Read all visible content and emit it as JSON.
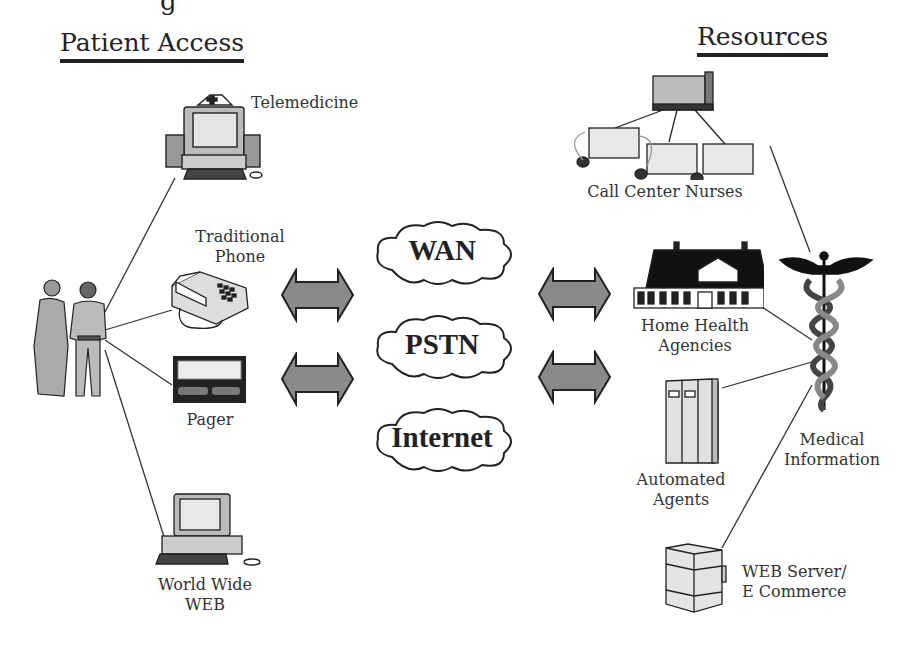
{
  "top_partial_text": "g",
  "sections": {
    "patient_access": {
      "title": "Patient Access"
    },
    "resources": {
      "title": "Resources"
    }
  },
  "patient_access_items": [
    {
      "id": "telemedicine",
      "label": "Telemedicine",
      "icon": "computer-nurse-cap-icon"
    },
    {
      "id": "phone",
      "label_line1": "Traditional",
      "label_line2": "Phone",
      "icon": "telephone-icon"
    },
    {
      "id": "pager",
      "label": "Pager",
      "icon": "pager-icon"
    },
    {
      "id": "web",
      "label_line1": "World Wide",
      "label_line2": "WEB",
      "icon": "desktop-computer-icon"
    }
  ],
  "networks": [
    {
      "label": "WAN"
    },
    {
      "label": "PSTN"
    },
    {
      "label": "Internet"
    }
  ],
  "resources_items": [
    {
      "id": "call_center",
      "label": "Call Center Nurses",
      "icon": "call-center-icon"
    },
    {
      "id": "home_health",
      "label_line1": "Home Health",
      "label_line2": "Agencies",
      "icon": "house-icon"
    },
    {
      "id": "automated_agents",
      "label_line1": "Automated",
      "label_line2": "Agents",
      "icon": "server-cabinet-icon"
    },
    {
      "id": "web_server",
      "label_line1": "WEB Server/",
      "label_line2": "E Commerce",
      "icon": "web-server-icon"
    },
    {
      "id": "medical_info",
      "label_line1": "Medical",
      "label_line2": "Information",
      "icon": "caduceus-icon"
    }
  ],
  "colors": {
    "ink": "#222222",
    "arrow_fill": "#8a8a8a",
    "screen": "#e8e8e8",
    "body_gray": "#bdbdbd"
  }
}
